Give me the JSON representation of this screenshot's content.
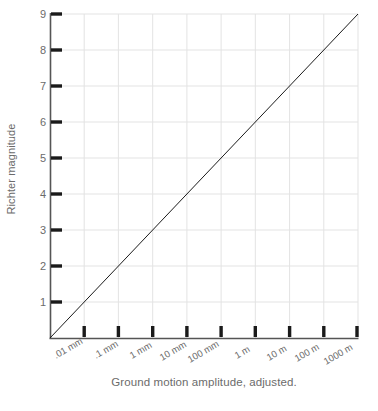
{
  "chart_data": {
    "type": "line",
    "title": "",
    "xlabel": "Ground motion amplitude, adjusted.",
    "ylabel": "Richter magnitude",
    "grid": true,
    "legend": "none",
    "x_tick_labels": [
      ".01 mm",
      ".1 mm",
      "1 mm",
      "10 mm",
      "100 mm",
      "1 m",
      "10 m",
      "100 m",
      "1000 m"
    ],
    "y_tick_labels": [
      "1",
      "2",
      "3",
      "4",
      "5",
      "6",
      "7",
      "8",
      "9"
    ],
    "x_tick_values": [
      0.01,
      0.1,
      1,
      10,
      100,
      1000,
      10000,
      100000,
      1000000
    ],
    "y_tick_values": [
      1,
      2,
      3,
      4,
      5,
      6,
      7,
      8,
      9
    ],
    "ylim": [
      0,
      9
    ],
    "xlim_decades": [
      -3,
      6
    ],
    "x_scale": "log",
    "series": [
      {
        "name": "Richter magnitude vs amplitude",
        "x": [
          0.001,
          0.01,
          0.1,
          1,
          10,
          100,
          1000,
          10000,
          100000,
          1000000
        ],
        "y": [
          0,
          1,
          2,
          3,
          4,
          5,
          6,
          7,
          8,
          9
        ],
        "color": "#1a1a1a",
        "line_width": 1
      }
    ],
    "colors": {
      "line": "#1a1a1a",
      "axis": "#4a4a4a",
      "grid": "#e3e3e3",
      "tick_mark": "#1a1a1a",
      "text": "#6b6b6b",
      "background": "#ffffff"
    },
    "annotations": []
  }
}
